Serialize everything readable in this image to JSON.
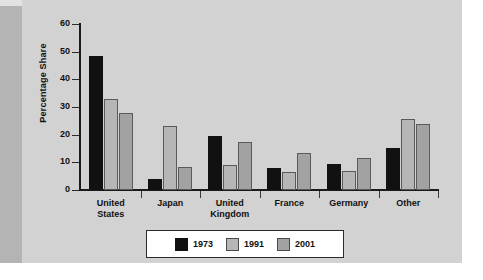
{
  "chart_data": {
    "type": "bar",
    "title": "",
    "xlabel": "",
    "ylabel": "Percentage Share",
    "ylim": [
      0,
      60
    ],
    "yticks": [
      0,
      10,
      20,
      30,
      40,
      50,
      60
    ],
    "grid": false,
    "legend_position": "bottom",
    "categories": [
      "United\nStates",
      "Japan",
      "United\nKingdom",
      "France",
      "Germany",
      "Other"
    ],
    "series": [
      {
        "name": "1973",
        "color": "#111111",
        "values": [
          48.5,
          4.0,
          19.5,
          7.8,
          9.4,
          15.1
        ]
      },
      {
        "name": "1991",
        "color": "#b6b6b6",
        "values": [
          33.0,
          23.3,
          9.0,
          6.6,
          7.0,
          25.5
        ]
      },
      {
        "name": "2001",
        "color": "#a2a2a2",
        "values": [
          27.9,
          8.2,
          17.4,
          13.5,
          11.5,
          23.8
        ]
      }
    ]
  },
  "legend": {
    "items": [
      {
        "label": "1973",
        "swatch": "black-swatch"
      },
      {
        "label": "1991",
        "swatch": "light-gray-swatch"
      },
      {
        "label": "2001",
        "swatch": "medium-gray-swatch"
      }
    ]
  },
  "axis": {
    "y_title": "Percentage Share",
    "y_tick_labels": [
      "60",
      "50",
      "40",
      "30",
      "20",
      "10",
      "0"
    ]
  },
  "colors": {
    "page_background": "#d3d3d3",
    "gutter_band": "#b4b4b4",
    "axis": "#1a1a1a",
    "text": "#111111",
    "legend_background": "#ffffff"
  }
}
